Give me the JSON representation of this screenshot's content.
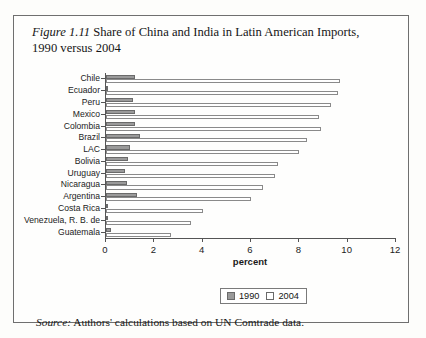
{
  "figure": {
    "number": "Figure 1.11",
    "title": " Share of China and India in Latin American Imports, 1990 versus 2004",
    "source_prefix": "Source:",
    "source_text": " Authors' calculations based on UN Comtrade data."
  },
  "legend": {
    "items": [
      {
        "label": "1990",
        "swatch": "gray",
        "color": "#9a9a9a"
      },
      {
        "label": "2004",
        "swatch": "white",
        "color": "#ffffff"
      }
    ]
  },
  "chart_data": {
    "type": "bar",
    "orientation": "horizontal",
    "title": "Share of China and India in Latin American Imports, 1990 versus 2004",
    "xlabel": "percent",
    "ylabel": "",
    "xlim": [
      0,
      12
    ],
    "xticks": [
      0,
      2,
      4,
      6,
      8,
      10,
      12
    ],
    "xticklabels": [
      "0",
      "2",
      "4",
      "6",
      "8",
      "10",
      "12"
    ],
    "grid": false,
    "legend_position": "bottom-center",
    "categories": [
      "Chile",
      "Ecuador",
      "Peru",
      "Mexico",
      "Colombia",
      "Brazil",
      "LAC",
      "Bolivia",
      "Uruguay",
      "Nicaragua",
      "Argentina",
      "Costa Rica",
      "Venezuela, R. B. de",
      "Guatemala"
    ],
    "series": [
      {
        "name": "1990",
        "values": [
          1.2,
          0.1,
          1.1,
          1.2,
          1.2,
          1.4,
          1.0,
          0.9,
          0.8,
          0.85,
          1.3,
          0.1,
          0.1,
          0.2
        ]
      },
      {
        "name": "2004",
        "values": [
          9.7,
          9.6,
          9.3,
          8.8,
          8.9,
          8.3,
          8.0,
          7.1,
          7.0,
          6.5,
          6.0,
          4.0,
          3.5,
          2.7
        ]
      }
    ]
  }
}
